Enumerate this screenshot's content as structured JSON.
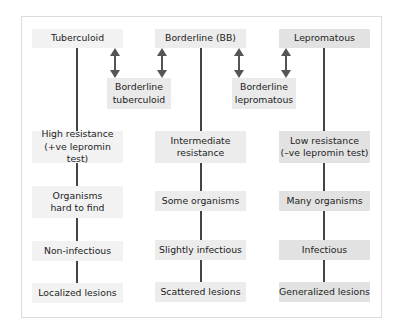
{
  "diagram": {
    "columns": [
      {
        "header": "Tuberculoid",
        "items": [
          "High resistance\n(+ve lepromin test)",
          "Organisms\nhard to find",
          "Non-infectious",
          "Localized lesions"
        ]
      },
      {
        "header": "Borderline (BB)",
        "items": [
          "Intermediate\nresistance",
          "Some organisms",
          "Slightly infectious",
          "Scattered lesions"
        ]
      },
      {
        "header": "Lepromatous",
        "items": [
          "Low resistance\n(–ve lepromin test)",
          "Many organisms",
          "Infectious",
          "Generalized lesions"
        ]
      }
    ],
    "intermediates": [
      {
        "label": "Borderline\ntuberculoid"
      },
      {
        "label": "Borderline\nlepromatous"
      }
    ],
    "colors": {
      "line": "#444444",
      "frame": "#dcdcdc",
      "tb_box": "#f2f2f2",
      "bb_box": "#ececec",
      "ll_box": "#e2e2e2"
    }
  }
}
